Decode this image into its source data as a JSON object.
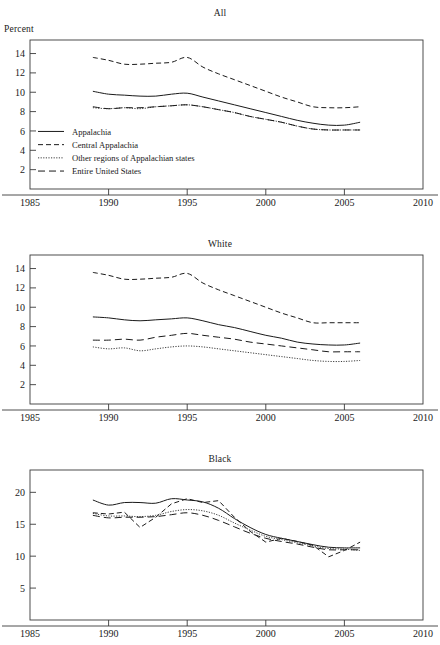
{
  "figure": {
    "ylabel": "Percent",
    "xticks": [
      1985,
      1990,
      1995,
      2000,
      2005,
      2010
    ],
    "xlim": [
      1985,
      2010
    ],
    "legend": [
      {
        "label": "Appalachia",
        "style": "solid"
      },
      {
        "label": "Central Appalachia",
        "style": "dashed"
      },
      {
        "label": "Other regions of Appalachian states",
        "style": "dotted"
      },
      {
        "label": "Entire United States",
        "style": "longdash"
      }
    ]
  },
  "chart_data": [
    {
      "type": "line",
      "title": "All",
      "xlabel": "",
      "ylabel": "Percent",
      "xlim": [
        1985,
        2010
      ],
      "ylim": [
        0,
        15.4
      ],
      "xticks": [
        1985,
        1990,
        1995,
        2000,
        2005,
        2010
      ],
      "yticks": [
        2,
        4,
        6,
        8,
        10,
        12,
        14
      ],
      "grid": false,
      "legend_position": "lower-left inside axes",
      "x": [
        1989,
        1990,
        1991,
        1992,
        1993,
        1994,
        1995,
        1996,
        1997,
        1998,
        1999,
        2000,
        2001,
        2002,
        2003,
        2004,
        2005,
        2006
      ],
      "series": [
        {
          "name": "Appalachia",
          "style": "solid",
          "values": [
            10.1,
            9.8,
            9.7,
            9.6,
            9.6,
            9.8,
            9.9,
            9.5,
            9.1,
            8.7,
            8.3,
            7.9,
            7.5,
            7.1,
            6.8,
            6.6,
            6.6,
            6.9
          ]
        },
        {
          "name": "Central Appalachia",
          "style": "dashed",
          "values": [
            13.6,
            13.3,
            12.9,
            12.9,
            13.0,
            13.1,
            13.6,
            12.6,
            11.9,
            11.3,
            10.7,
            10.1,
            9.5,
            9.0,
            8.5,
            8.4,
            8.4,
            8.5
          ]
        },
        {
          "name": "Other regions of Appalachian states",
          "style": "dotted",
          "values": [
            8.4,
            8.3,
            8.4,
            8.3,
            8.5,
            8.6,
            8.7,
            8.5,
            8.2,
            7.9,
            7.5,
            7.2,
            6.9,
            6.5,
            6.2,
            6.1,
            6.1,
            6.1
          ]
        },
        {
          "name": "Entire United States",
          "style": "longdash",
          "values": [
            8.5,
            8.3,
            8.4,
            8.4,
            8.5,
            8.6,
            8.7,
            8.5,
            8.2,
            7.9,
            7.5,
            7.2,
            6.9,
            6.5,
            6.2,
            6.1,
            6.1,
            6.1
          ]
        }
      ]
    },
    {
      "type": "line",
      "title": "White",
      "xlabel": "",
      "ylabel": "Percent",
      "xlim": [
        1985,
        2010
      ],
      "ylim": [
        0,
        15.4
      ],
      "xticks": [
        1985,
        1990,
        1995,
        2000,
        2005,
        2010
      ],
      "yticks": [
        2,
        4,
        6,
        8,
        10,
        12,
        14
      ],
      "grid": false,
      "legend_position": "none",
      "x": [
        1989,
        1990,
        1991,
        1992,
        1993,
        1994,
        1995,
        1996,
        1997,
        1998,
        1999,
        2000,
        2001,
        2002,
        2003,
        2004,
        2005,
        2006
      ],
      "series": [
        {
          "name": "Appalachia",
          "style": "solid",
          "values": [
            9.0,
            8.9,
            8.7,
            8.6,
            8.7,
            8.8,
            8.9,
            8.6,
            8.2,
            7.9,
            7.5,
            7.1,
            6.8,
            6.4,
            6.2,
            6.1,
            6.1,
            6.3
          ]
        },
        {
          "name": "Central Appalachia",
          "style": "dashed",
          "values": [
            13.6,
            13.3,
            12.9,
            12.9,
            13.0,
            13.1,
            13.5,
            12.5,
            11.8,
            11.2,
            10.6,
            10.0,
            9.4,
            8.9,
            8.4,
            8.4,
            8.4,
            8.4
          ]
        },
        {
          "name": "Other regions of Appalachian states",
          "style": "dotted",
          "values": [
            5.9,
            5.7,
            5.8,
            5.5,
            5.7,
            5.9,
            6.0,
            5.9,
            5.7,
            5.5,
            5.3,
            5.1,
            4.9,
            4.7,
            4.5,
            4.4,
            4.4,
            4.5
          ]
        },
        {
          "name": "Entire United States",
          "style": "longdash",
          "values": [
            6.6,
            6.6,
            6.7,
            6.6,
            6.9,
            7.1,
            7.3,
            7.1,
            6.9,
            6.7,
            6.4,
            6.2,
            6.0,
            5.8,
            5.6,
            5.4,
            5.4,
            5.4
          ]
        }
      ]
    },
    {
      "type": "line",
      "title": "Black",
      "xlabel": "",
      "ylabel": "Percent",
      "xlim": [
        1985,
        2010
      ],
      "ylim": [
        0,
        23.5
      ],
      "xticks": [
        1985,
        1990,
        1995,
        2000,
        2005,
        2010
      ],
      "yticks": [
        5,
        10,
        15,
        20
      ],
      "grid": false,
      "legend_position": "none",
      "x": [
        1989,
        1990,
        1991,
        1992,
        1993,
        1994,
        1995,
        1996,
        1997,
        1998,
        1999,
        2000,
        2001,
        2002,
        2003,
        2004,
        2005,
        2006
      ],
      "series": [
        {
          "name": "Appalachia",
          "style": "solid",
          "values": [
            18.8,
            18.0,
            18.4,
            18.4,
            18.3,
            19.0,
            18.8,
            18.5,
            17.5,
            15.9,
            14.5,
            13.4,
            12.8,
            12.3,
            11.8,
            11.4,
            11.3,
            11.3
          ]
        },
        {
          "name": "Central Appalachia",
          "style": "dashed",
          "values": [
            16.8,
            16.6,
            16.9,
            14.5,
            16.1,
            18.2,
            19.0,
            18.4,
            18.7,
            16.1,
            13.9,
            12.2,
            12.8,
            12.3,
            11.7,
            9.9,
            10.9,
            12.2
          ]
        },
        {
          "name": "Other regions of Appalachian states",
          "style": "dotted",
          "values": [
            16.7,
            16.3,
            16.3,
            16.2,
            16.4,
            17.0,
            17.3,
            17.1,
            16.4,
            15.2,
            14.1,
            13.1,
            12.6,
            12.1,
            11.6,
            11.2,
            11.1,
            10.9
          ]
        },
        {
          "name": "Entire United States",
          "style": "longdash",
          "values": [
            16.4,
            16.0,
            16.1,
            16.1,
            16.2,
            16.5,
            16.8,
            16.4,
            15.6,
            14.6,
            13.6,
            12.8,
            12.3,
            11.9,
            11.4,
            11.0,
            11.0,
            11.0
          ]
        }
      ]
    }
  ]
}
